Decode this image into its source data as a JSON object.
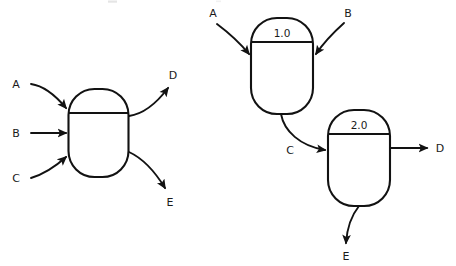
{
  "figure": {
    "background_color": "#ffffff",
    "line_color": "#121212",
    "text_color": "#1a1a1a"
  },
  "diagrams": [
    {
      "id": "left-diagram",
      "name": "single-unit-flowsheet",
      "units": [
        {
          "id": "unit-left",
          "name": "process-vessel",
          "label": "",
          "has_label": false
        }
      ],
      "streams": [
        {
          "id": "in-a",
          "label": "A",
          "direction": "inlet",
          "style": "curved"
        },
        {
          "id": "in-b",
          "label": "B",
          "direction": "inlet",
          "style": "straight"
        },
        {
          "id": "in-c",
          "label": "C",
          "direction": "inlet",
          "style": "curved"
        },
        {
          "id": "out-d",
          "label": "D",
          "direction": "outlet",
          "style": "curved"
        },
        {
          "id": "out-e",
          "label": "E",
          "direction": "outlet",
          "style": "curved"
        }
      ]
    },
    {
      "id": "right-diagram",
      "name": "two-unit-flowsheet",
      "units": [
        {
          "id": "unit-1",
          "name": "process-vessel-1",
          "label": "1.0",
          "has_label": true
        },
        {
          "id": "unit-2",
          "name": "process-vessel-2",
          "label": "2.0",
          "has_label": true
        }
      ],
      "streams": [
        {
          "id": "in-a2",
          "label": "A",
          "direction": "inlet",
          "style": "curved"
        },
        {
          "id": "in-b2",
          "label": "B",
          "direction": "inlet",
          "style": "curved"
        },
        {
          "id": "mid-c",
          "label": "C",
          "direction": "intermediate",
          "style": "curved"
        },
        {
          "id": "out-d2",
          "label": "D",
          "direction": "outlet",
          "style": "straight"
        },
        {
          "id": "out-e2",
          "label": "E",
          "direction": "outlet",
          "style": "curved"
        }
      ]
    }
  ]
}
